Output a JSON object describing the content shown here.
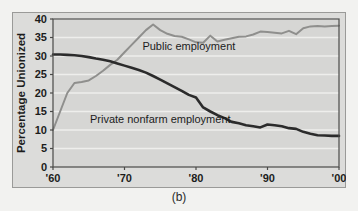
{
  "caption": "(b)",
  "chart_data": {
    "type": "line",
    "title": "",
    "xlabel": "",
    "ylabel": "Percentage Unionized",
    "xlim": [
      1960,
      2000
    ],
    "ylim": [
      0,
      40
    ],
    "xticks": [
      1960,
      1970,
      1980,
      1990,
      2000
    ],
    "xticklabels": [
      "'60",
      "'70",
      "'80",
      "'90",
      "'00"
    ],
    "yticks": [
      0,
      5,
      10,
      15,
      20,
      25,
      30,
      35,
      40
    ],
    "yticklabels": [
      "0",
      "5",
      "10",
      "15",
      "20",
      "25",
      "30",
      "35",
      "40"
    ],
    "grid": "horizontal",
    "legend": "inline-annotations",
    "plot_background": "#d6d6d4",
    "grid_color": "#eeeeec",
    "series": [
      {
        "name": "Public employment",
        "color": "#8f8f8d",
        "label_x": 1979,
        "label_y": 31.5,
        "x": [
          1960,
          1961,
          1962,
          1963,
          1964,
          1965,
          1966,
          1967,
          1968,
          1969,
          1970,
          1971,
          1972,
          1973,
          1974,
          1975,
          1976,
          1977,
          1978,
          1979,
          1980,
          1981,
          1982,
          1983,
          1984,
          1985,
          1986,
          1987,
          1988,
          1989,
          1990,
          1991,
          1992,
          1993,
          1994,
          1995,
          1996,
          1997,
          1998,
          1999,
          2000
        ],
        "y": [
          10.0,
          15.0,
          20.0,
          22.7,
          23.0,
          23.4,
          24.6,
          26.0,
          27.6,
          29.0,
          31.0,
          33.0,
          35.0,
          37.0,
          38.5,
          37.0,
          36.0,
          35.4,
          35.2,
          34.5,
          33.7,
          33.6,
          35.5,
          33.9,
          34.4,
          34.8,
          35.2,
          35.3,
          35.8,
          36.6,
          36.5,
          36.3,
          36.1,
          36.8,
          35.9,
          37.5,
          38.0,
          38.1,
          38.0,
          38.1,
          38.2
        ]
      },
      {
        "name": "Private nonfarm employment",
        "color": "#2b2b2b",
        "label_x": 1975,
        "label_y": 12.0,
        "x": [
          1960,
          1961,
          1962,
          1963,
          1964,
          1965,
          1966,
          1967,
          1968,
          1969,
          1970,
          1971,
          1972,
          1973,
          1974,
          1975,
          1976,
          1977,
          1978,
          1979,
          1980,
          1981,
          1982,
          1983,
          1984,
          1985,
          1986,
          1987,
          1988,
          1989,
          1990,
          1991,
          1992,
          1993,
          1994,
          1995,
          1996,
          1997,
          1998,
          1999,
          2000
        ],
        "y": [
          30.4,
          30.4,
          30.3,
          30.2,
          30.0,
          29.7,
          29.3,
          29.0,
          28.6,
          28.0,
          27.4,
          26.8,
          26.2,
          25.5,
          24.6,
          23.6,
          22.6,
          21.6,
          20.6,
          19.5,
          18.8,
          16.1,
          15.0,
          14.0,
          13.2,
          12.2,
          11.8,
          11.3,
          11.0,
          10.7,
          11.5,
          11.3,
          11.0,
          10.5,
          10.3,
          9.5,
          9.0,
          8.6,
          8.5,
          8.4,
          8.4
        ]
      }
    ]
  }
}
